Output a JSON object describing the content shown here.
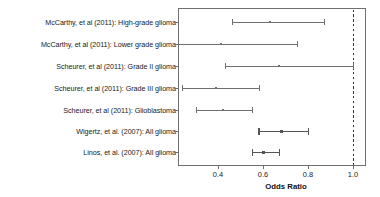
{
  "chart_data": {
    "type": "scatter",
    "subtype": "forest-plot",
    "title": "",
    "xlabel": "Odds Ratio",
    "ylabel": "",
    "xlim": [
      0.2,
      1.04
    ],
    "xticks": [
      0.4,
      0.6,
      0.8,
      1.0
    ],
    "xticklabels": [
      "0.4",
      "0.6",
      "0.8",
      "1.0"
    ],
    "grid": false,
    "legend": null,
    "reference_line": {
      "value": 1.0,
      "style": "dashed",
      "label": "1.0",
      "color": "#333333"
    },
    "marker": "point-with-horizontal-error-bars",
    "categories": [
      "McCarthy, et al (2011): High-grade glioma",
      "McCarthy, et al (2011): Lower grade glioma",
      "Scheurer, et al (2011): Grade II glioma",
      "Scheurer, et al (2011): Grade III glioma",
      "Scheurer, et al (2011): Glioblastoma",
      "Wigertz, et al. (2007): All glioma",
      "Linos, et al. (2007): All glioma"
    ],
    "points": [
      {
        "label": "McCarthy, et al (2011): High-grade glioma",
        "estimate": 0.63,
        "ci_low": 0.46,
        "ci_high": 0.87,
        "ci_high_clipped": false
      },
      {
        "label": "McCarthy, et al (2011): Lower grade glioma",
        "estimate": 0.41,
        "ci_low": 0.22,
        "ci_high": 0.75,
        "ci_high_clipped": false
      },
      {
        "label": "Scheurer, et al (2011): Grade II glioma",
        "estimate": 0.67,
        "ci_low": 0.43,
        "ci_high": 1.0,
        "ci_high_clipped": false
      },
      {
        "label": "Scheurer, et al (2011): Grade III glioma",
        "estimate": 0.39,
        "ci_low": 0.24,
        "ci_high": 0.58,
        "ci_high_clipped": false
      },
      {
        "label": "Scheurer, et al (2011): Glioblastoma",
        "estimate": 0.42,
        "ci_low": 0.3,
        "ci_high": 0.55,
        "ci_high_clipped": false
      },
      {
        "label": "Wigertz, et al. (2007): All glioma",
        "estimate": 0.68,
        "ci_low": 0.58,
        "ci_high": 0.8,
        "ci_high_clipped": false
      },
      {
        "label": "Linos, et al. (2007): All glioma",
        "estimate": 0.6,
        "ci_low": 0.55,
        "ci_high": 0.67,
        "ci_high_clipped": false
      }
    ],
    "colors": {
      "frame": "#6e6e6e",
      "series": "#707070",
      "series_emphasis": "#555555",
      "reference": "#2b2b2b",
      "text": "#1a1a1a",
      "background": "#ffffff"
    }
  },
  "axis": {
    "x_title": "Odds Ratio",
    "ticks": [
      {
        "value": 0.4,
        "label": "0.4"
      },
      {
        "value": 0.6,
        "label": "0.6"
      },
      {
        "value": 0.8,
        "label": "0.8"
      },
      {
        "value": 1.0,
        "label": "1.0"
      }
    ]
  },
  "rows": [
    {
      "label": "McCarthy, et al (2011): High-grade glioma"
    },
    {
      "label": "McCarthy, et al (2011): Lower grade glioma"
    },
    {
      "label": "Scheurer, et al (2011): Grade II glioma"
    },
    {
      "label": "Scheurer, et al (2011): Grade III glioma"
    },
    {
      "label": "Scheurer, et al (2011): Glioblastoma"
    },
    {
      "label": "Wigertz, et al. (2007): All glioma"
    },
    {
      "label": "Linos, et al. (2007): All glioma"
    }
  ]
}
